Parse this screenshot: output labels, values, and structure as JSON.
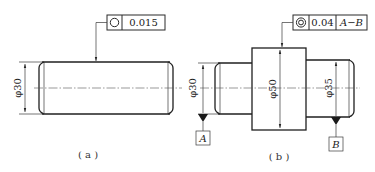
{
  "figure_a": {
    "caption": "( a )",
    "tolerance_frame": {
      "symbol": "circularity-icon",
      "value": "0.015"
    },
    "diameter_label": "φ30"
  },
  "figure_b": {
    "caption": "( b )",
    "tolerance_frame": {
      "symbol": "concentricity-icon",
      "value": "0.04",
      "datum_ref": "A−B"
    },
    "diameter_labels": {
      "left": "φ30",
      "middle": "φ50",
      "right": "φ35"
    },
    "datums": {
      "left": "A",
      "right": "B"
    }
  }
}
